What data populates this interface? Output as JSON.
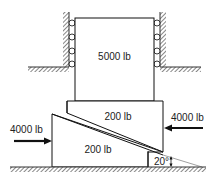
{
  "diagram": {
    "type": "mechanics-wedge-problem",
    "upper_block": {
      "label": "5000 lb"
    },
    "middle_block": {
      "label": "200 lb"
    },
    "wedge": {
      "label": "200 lb"
    },
    "force_left": {
      "label": "4000 lb",
      "direction": "right"
    },
    "force_right": {
      "label": "4000 lb",
      "direction": "left"
    },
    "angle": {
      "label": "20°"
    },
    "rollers_per_side": 4,
    "colors": {
      "line": "#111111",
      "hatch": "#555555",
      "background": "#ffffff"
    }
  }
}
